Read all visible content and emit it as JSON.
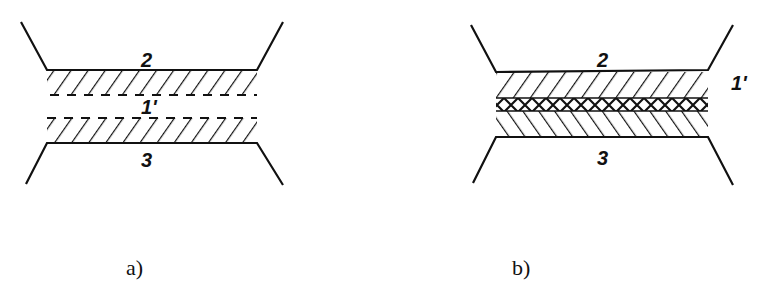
{
  "figure": {
    "panels": [
      {
        "id": "a",
        "caption": "a)",
        "labels": {
          "top": "2",
          "middle": "1'",
          "bottom": "3"
        },
        "description": "Two separated hatched layers (2 above, 3 below) with a gap labeled 1'"
      },
      {
        "id": "b",
        "caption": "b)",
        "labels": {
          "top": "2",
          "middle": "1'",
          "bottom": "3"
        },
        "description": "Hatched layers 2 and 3 joined by a cross-hatched interface layer 1'"
      }
    ],
    "colors": {
      "ink": "#111111",
      "background": "#ffffff"
    }
  }
}
